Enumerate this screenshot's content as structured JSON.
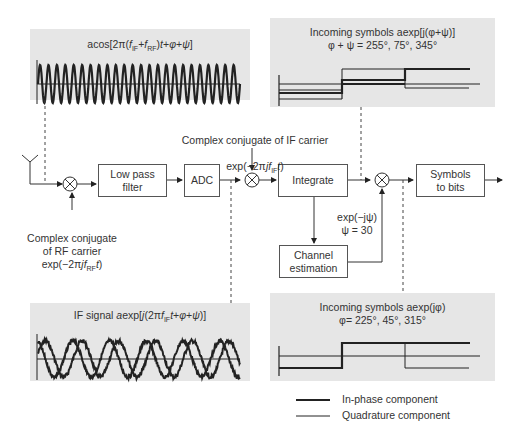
{
  "panels": {
    "rf_signal": {
      "title": "acos[2π(f_IF+f_RF)t+φ+ψ]"
    },
    "if_signal": {
      "title": "IF signal aexp[j(2πf_IFt+φ+ψ)]"
    },
    "symbols_rotated": {
      "title_line1": "Incoming symbols aexp[j(φ+ψ)]",
      "title_line2": "φ + ψ = 255°, 75°, 345°"
    },
    "symbols_corrected": {
      "title_line1": "Incoming symbols aexp(jφ)",
      "title_line2": "φ= 225°, 45°, 315°"
    }
  },
  "blocks": {
    "lpf": "Low pass\nfilter",
    "adc": "ADC",
    "integrate": "Integrate",
    "symbols_to_bits": "Symbols\nto bits",
    "channel_estimation": "Channel\nestimation"
  },
  "labels": {
    "rf_conjugate": "Complex conjugate\nof RF carrier\nexp(−2πjf_RFt)",
    "if_conjugate_line1": "Complex conjugate of IF carrier",
    "if_conjugate_line2": "exp(−2πjf_IFt)",
    "phase_correction": "exp(−jψ)\nψ = 30"
  },
  "legend": {
    "in_phase": "In-phase component",
    "quadrature": "Quadrature component"
  },
  "colors": {
    "panel_bg": "#e6e6e6",
    "line": "#222222",
    "block_border": "#555555"
  },
  "chart_data": [
    {
      "type": "line",
      "title": "acos[2π(f_IF+f_RF)t+φ+ψ]",
      "description": "High-frequency RF sinusoid, ~24 cycles across window, with zero baseline",
      "series": [
        {
          "name": "RF signal",
          "cycles": 24
        }
      ]
    },
    {
      "type": "line",
      "title": "IF signal aexp[j(2πf_IFt+φ+ψ)]",
      "description": "Noisy IF in-phase and quadrature sinusoids, ~5.5 cycles, with zero baseline",
      "series": [
        {
          "name": "In-phase",
          "cycles": 5.5
        },
        {
          "name": "Quadrature",
          "cycles": 5.5
        }
      ]
    },
    {
      "type": "line",
      "title": "Incoming symbols aexp[j(φ+ψ)] — φ + ψ = 255°, 75°, 345°",
      "categories": [
        "symbol 1",
        "symbol 2",
        "symbol 3"
      ],
      "series": [
        {
          "name": "In-phase component",
          "phase_deg": [
            255,
            75,
            345
          ],
          "values": [
            -0.26,
            0.26,
            0.97
          ]
        },
        {
          "name": "Quadrature component",
          "phase_deg": [
            255,
            75,
            345
          ],
          "values": [
            -0.97,
            0.97,
            -0.26
          ]
        }
      ]
    },
    {
      "type": "line",
      "title": "Incoming symbols aexp(jφ) — φ= 225°, 45°, 315°",
      "categories": [
        "symbol 1",
        "symbol 2",
        "symbol 3"
      ],
      "series": [
        {
          "name": "In-phase component",
          "phase_deg": [
            225,
            45,
            315
          ],
          "values": [
            -0.71,
            0.71,
            0.71
          ]
        },
        {
          "name": "Quadrature component",
          "phase_deg": [
            225,
            45,
            315
          ],
          "values": [
            -0.71,
            0.71,
            -0.71
          ]
        }
      ]
    }
  ]
}
